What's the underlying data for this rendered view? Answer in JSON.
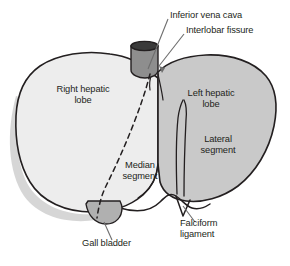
{
  "figure": {
    "type": "anatomical-diagram",
    "background_color": "#ffffff"
  },
  "colors": {
    "outline": "#231f20",
    "right_lobe_fill": "#ededed",
    "left_lobe_fill": "#c9c9c9",
    "gall_bladder_fill": "#b0b0b0",
    "vena_cava_fill": "#8e8e8e",
    "vena_cava_rim": "#3a3a3a",
    "shadow": "#b5b5b5",
    "label_text": "#231f20",
    "leader_line": "#6e6e6e"
  },
  "labels": {
    "inferior_vena_cava": "Inferior vena cava",
    "interlobar_fissure": "Interlobar fissure",
    "right_hepatic_lobe": "Right hepatic\nlobe",
    "left_hepatic_lobe": "Left hepatic\nlobe",
    "lateral_segment": "Lateral\nsegment",
    "median_segment": "Median\nsegment",
    "gall_bladder": "Gall bladder",
    "falciform_ligament": "Falciform\nligament"
  },
  "structures": [
    {
      "name": "inferior-vena-cava",
      "label": "Inferior vena cava",
      "leader": true
    },
    {
      "name": "interlobar-fissure",
      "label": "Interlobar fissure",
      "leader": true
    },
    {
      "name": "right-hepatic-lobe",
      "label": "Right hepatic lobe",
      "leader": false
    },
    {
      "name": "left-hepatic-lobe",
      "label": "Left hepatic lobe",
      "leader": false
    },
    {
      "name": "lateral-segment",
      "label": "Lateral segment",
      "leader": false
    },
    {
      "name": "median-segment",
      "label": "Median segment",
      "leader": false
    },
    {
      "name": "gall-bladder",
      "label": "Gall bladder",
      "leader": true
    },
    {
      "name": "falciform-ligament",
      "label": "Falciform ligament",
      "leader": true
    }
  ]
}
